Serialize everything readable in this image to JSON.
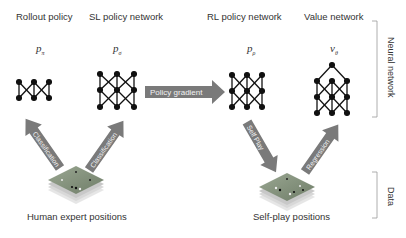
{
  "networks": [
    {
      "title": "Rollout policy",
      "symbol": "p",
      "subscript": "π"
    },
    {
      "title": "SL policy network",
      "symbol": "p",
      "subscript": "σ"
    },
    {
      "title": "RL policy network",
      "symbol": "p",
      "subscript": "ρ"
    },
    {
      "title": "Value network",
      "symbol": "v",
      "subscript": "θ"
    }
  ],
  "arrows": {
    "policy_gradient": "Policy gradient",
    "classification_left": "Classification",
    "classification_right": "Classification",
    "self_play": "Self Play",
    "regression": "Regression"
  },
  "data_labels": {
    "human": "Human expert positions",
    "selfplay": "Self-play positions"
  },
  "side_labels": {
    "neural_network": "Neural network",
    "data": "Data"
  },
  "colors": {
    "arrow": "#7a7a7a",
    "arrow_text": "#f2f2f2",
    "node": "#111111",
    "board_top": "#8a9a82",
    "board_layers": "#c9c9c9"
  }
}
